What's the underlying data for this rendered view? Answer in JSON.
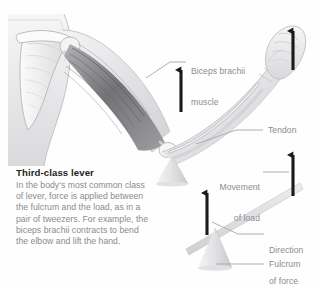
{
  "figure": {
    "kind": "anatomy-lever-diagram",
    "title": "Third-class lever",
    "body": "In the body's most common class of lever, force is applied between the fulcrum and the load, as in a pair of tweezers. For example, the biceps brachii contracts to bend the elbow and lift the hand."
  },
  "labels": {
    "biceps_line1": "Biceps brachii",
    "biceps_line2": "muscle",
    "tendon": "Tendon",
    "movement_line1": "Movement",
    "movement_line2": "of load",
    "direction_line1": "Direction",
    "direction_line2": "of force",
    "fulcrum": "Fulcrum"
  },
  "colors": {
    "arrow": "#1a1a1a",
    "leader": "#a8a8ab",
    "label_text": "#8c8c8f",
    "title_text": "#231f20",
    "body_text": "#8b8b8e",
    "bone_light": "#f2f2f3",
    "bone_mid": "#dcdcde",
    "bone_edge": "#b9b9bd",
    "muscle_dark": "#6f6f73",
    "muscle_mid": "#9a9a9e",
    "skin_light": "#ededee",
    "lever_bar": "#dededf",
    "fulcrum_fill": "#e6e6e7",
    "background": "#ffffff"
  },
  "arrows": [
    {
      "name": "force-arrow-arm",
      "x": 181,
      "y_tip": 63,
      "y_tail": 112
    },
    {
      "name": "load-arrow-hand",
      "x": 293,
      "y_tip": 24,
      "y_tail": 70
    },
    {
      "name": "load-arrow-lever",
      "x": 293,
      "y_tip": 148,
      "y_tail": 196
    },
    {
      "name": "force-arrow-lever",
      "x": 207,
      "y_tip": 186,
      "y_tail": 235
    }
  ]
}
